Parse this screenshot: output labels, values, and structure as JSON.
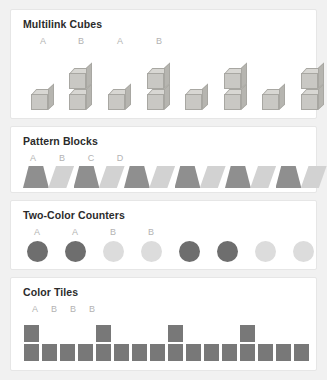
{
  "page": {
    "background": "#f1f1f1",
    "card_background": "#ffffff"
  },
  "sections": [
    {
      "id": "multilink-cubes",
      "title": "Multilink Cubes",
      "manipulative": "cube-tower",
      "labels": [
        "A",
        "B",
        "A",
        "B"
      ],
      "label_x": [
        20,
        58,
        97,
        136
      ],
      "unit_pattern": [
        "A",
        "B",
        "A",
        "B",
        "A",
        "B",
        "A",
        "B"
      ],
      "tower_heights": [
        1,
        2,
        1,
        2,
        1,
        2,
        1,
        2
      ],
      "tower_x": [
        8,
        46,
        85,
        124,
        162,
        201,
        239,
        278
      ],
      "colors": {
        "cube_front": "#c9c8c4",
        "cube_top": "#d8d7d3",
        "cube_side": "#b6b5b0",
        "cube_edge": "#a8a7a2"
      }
    },
    {
      "id": "pattern-blocks",
      "title": "Pattern Blocks",
      "manipulative": "trapezoid-strip",
      "labels": [
        "A",
        "B",
        "C",
        "D"
      ],
      "label_x": [
        10,
        39,
        68,
        97
      ],
      "unit_pattern": [
        "A",
        "B",
        "C",
        "D"
      ],
      "block_shapes": [
        "dark",
        "light",
        "dark",
        "light",
        "dark",
        "light",
        "dark",
        "light",
        "dark",
        "light",
        "dark",
        "light"
      ],
      "block_count": 12,
      "colors": {
        "dark_block": "#8f8f8f",
        "light_block": "#d2d2d2"
      }
    },
    {
      "id": "two-color-counters",
      "title": "Two-Color Counters",
      "manipulative": "round-counter",
      "labels": [
        "A",
        "A",
        "B",
        "B"
      ],
      "label_x": [
        14,
        52,
        90,
        128
      ],
      "unit_pattern": [
        "A",
        "A",
        "B",
        "B"
      ],
      "counter_values": [
        "A",
        "A",
        "B",
        "B",
        "A",
        "A",
        "B",
        "B"
      ],
      "counter_x": [
        14,
        52,
        90,
        128,
        166,
        204,
        242,
        280
      ],
      "colors": {
        "counter_a": "#6e6e6e",
        "counter_b": "#dcdcdc"
      }
    },
    {
      "id": "color-tiles",
      "title": "Color Tiles",
      "manipulative": "square-tile",
      "labels": [
        "A",
        "B",
        "B",
        "B"
      ],
      "label_x": [
        12,
        31,
        50,
        69
      ],
      "unit_pattern": [
        "A",
        "B",
        "B",
        "B"
      ],
      "tile_values": [
        "A",
        "B",
        "B",
        "B",
        "A",
        "B",
        "B",
        "B",
        "A",
        "B",
        "B",
        "B",
        "A",
        "B",
        "B",
        "B"
      ],
      "bottom_tile_count": 16,
      "tall_tile_positions": [
        0,
        4,
        8,
        12
      ],
      "tile_pitch": 18,
      "colors": {
        "tile": "#787878",
        "tile_gap": "#ffffff"
      }
    }
  ]
}
